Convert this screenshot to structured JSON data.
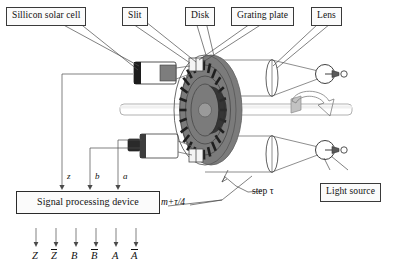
{
  "figure": {
    "kind": "photoelectric-rotary-encoder-schematic",
    "background": "#ffffff",
    "ink": "#1a1a1a"
  },
  "callouts": {
    "solar_cell": "Sillicon solar cell",
    "slit": "Slit",
    "disk": "Disk",
    "grating_plate": "Grating plate",
    "lens": "Lens",
    "light_source": "Light source",
    "signal_processing": "Signal processing device"
  },
  "annotations": {
    "offset": "m+τ/4",
    "step": "step τ"
  },
  "ports": {
    "z": "z",
    "b": "b",
    "a": "a"
  },
  "outputs": [
    {
      "name": "Z",
      "bar": false
    },
    {
      "name": "Z",
      "bar": true
    },
    {
      "name": "B",
      "bar": false
    },
    {
      "name": "B",
      "bar": true
    },
    {
      "name": "A",
      "bar": false
    },
    {
      "name": "A",
      "bar": true
    }
  ],
  "colors": {
    "disk_body": "#8d8d8d",
    "disk_rim": "#6f6f6f",
    "slot": "#2a2a2a",
    "shaft": "#b9b9b9",
    "cell_body": "#565656",
    "cell_dark": "#2b2b2b",
    "lens_glass": "#cfcfcf",
    "line": "#4a4a4a",
    "box_border": "#3a3a3a"
  }
}
